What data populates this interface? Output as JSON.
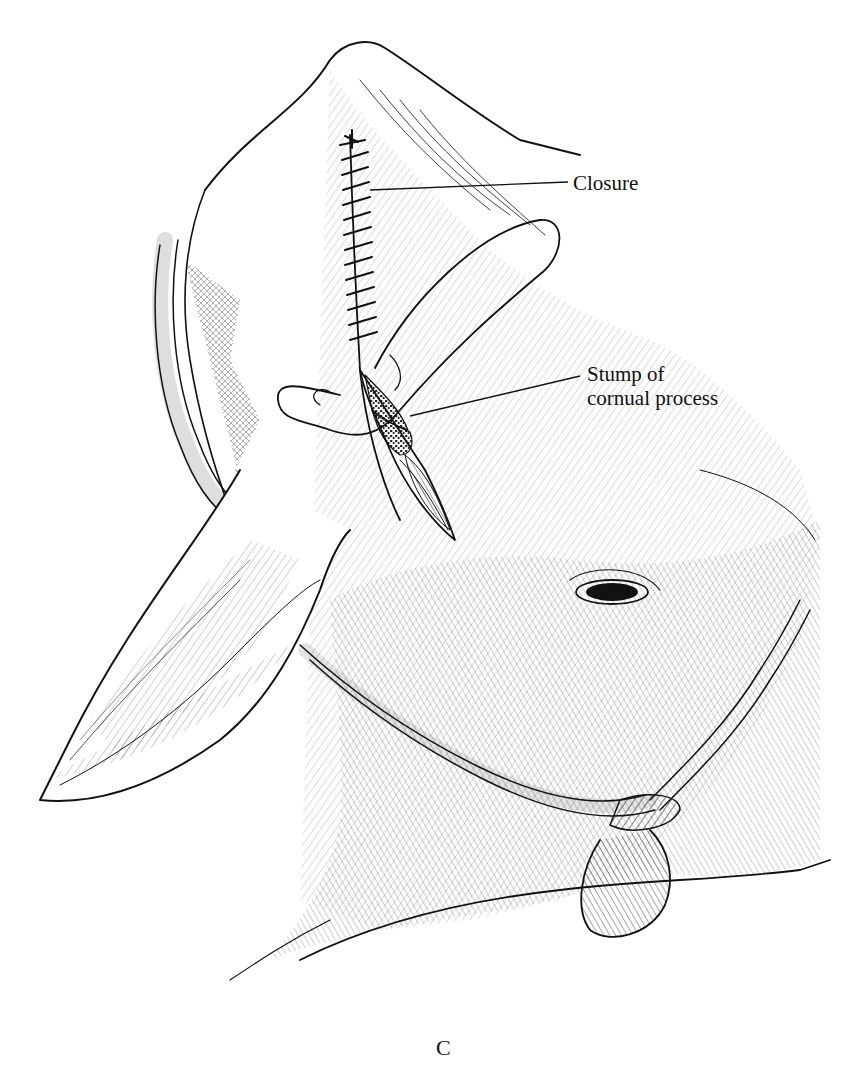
{
  "figure": {
    "panel_letter": "C",
    "labels": {
      "closure": "Closure",
      "stump_line1": "Stump of",
      "stump_line2": "cornual process"
    },
    "colors": {
      "ink": "#111111",
      "paper": "#ffffff"
    }
  }
}
